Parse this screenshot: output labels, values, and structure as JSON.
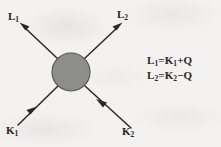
{
  "figure": {
    "background_color": "#f3f2f0",
    "ink_color": "#2a2927",
    "blob": {
      "name": "interaction-vertex",
      "shape": "circle",
      "fill_color": "#8d8d8a",
      "stroke_color": "#4a4a47",
      "center_x": 71,
      "center_y": 72,
      "radius": 19
    },
    "legs": [
      {
        "id": "L1",
        "label": "L",
        "subscript": "1",
        "direction": "outgoing",
        "arrow_position": "upper-left",
        "from_x": 57,
        "from_y": 58,
        "to_x": 20,
        "to_y": 23
      },
      {
        "id": "L2",
        "label": "L",
        "subscript": "2",
        "direction": "outgoing",
        "arrow_position": "upper-right",
        "from_x": 85,
        "from_y": 58,
        "to_x": 122,
        "to_y": 23
      },
      {
        "id": "K1",
        "label": "K",
        "subscript": "1",
        "direction": "incoming",
        "arrow_position": "lower-left",
        "from_x": 18,
        "from_y": 125,
        "to_x": 57,
        "to_y": 87
      },
      {
        "id": "K2",
        "label": "K",
        "subscript": "2",
        "direction": "incoming",
        "arrow_position": "lower-right",
        "from_x": 131,
        "from_y": 128,
        "to_x": 86,
        "to_y": 87
      }
    ],
    "equations": [
      {
        "lhs": "L",
        "lhs_sub": "1",
        "rhs_first": "K",
        "rhs_sub": "1",
        "operator": "+",
        "rhs_last": "Q",
        "text": "L1 = K1 + Q"
      },
      {
        "lhs": "L",
        "lhs_sub": "2",
        "rhs_first": "K",
        "rhs_sub": "2",
        "operator": "−",
        "rhs_last": "Q",
        "text": "L2 = K2 − Q"
      }
    ],
    "symbols": {
      "equals": "=",
      "plus": "+",
      "minus": "−",
      "momentum_transfer": "Q"
    }
  }
}
